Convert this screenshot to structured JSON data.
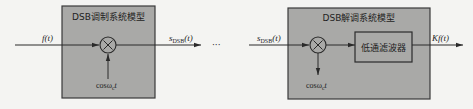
{
  "modulator": {
    "title": "DSB调制系统模型",
    "input_label": "f(t)",
    "multiplier_symbol": "×",
    "carrier_label_prefix": "cosω",
    "carrier_label_sub": "c",
    "carrier_label_suffix": "t",
    "output_label_main": "s",
    "output_label_sub": "DSB",
    "output_label_suffix": "(t)"
  },
  "channel": {
    "ellipsis": "···"
  },
  "demodulator": {
    "title": "DSB解调系统模型",
    "input_label_main": "s",
    "input_label_sub": "DSB",
    "input_label_suffix": "(t)",
    "multiplier_symbol": "×",
    "carrier_label_prefix": "cosω",
    "carrier_label_sub": "c",
    "carrier_label_suffix": "t",
    "filter_label": "低通滤波器",
    "output_label": "Kf(t)"
  },
  "colors": {
    "box_fill": "#a9a9a7",
    "line": "#2a2a2a",
    "background": "#f4f4f2"
  }
}
